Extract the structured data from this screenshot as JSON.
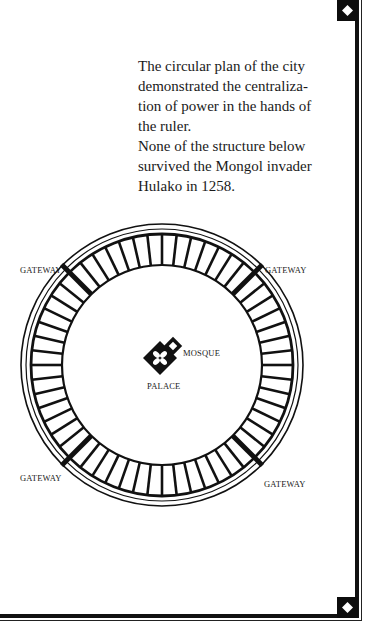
{
  "caption": {
    "paragraphs": [
      "The circular plan of the city demonstrated the centralization of power in the hands of the ruler.",
      "None of the structure below survived the Mongol invader Hulako in 1258."
    ],
    "lines": [
      "The circular plan of the city",
      "demonstrated the centraliza-",
      "tion of power in the hands of",
      "the ruler.",
      "None of the structure below",
      "survived the Mongol invader",
      "Hulako in 1258."
    ]
  },
  "diagram": {
    "labels": {
      "gateway_nw": "GATEWAY",
      "gateway_ne": "GATEWAY",
      "gateway_sw": "GATEWAY",
      "gateway_se": "GATEWAY",
      "mosque": "MOSQUE",
      "palace": "PALACE"
    },
    "ring": {
      "cx": 162,
      "cy": 365,
      "outer_r": 141,
      "outer_inner_r": 136,
      "wall_r": 131,
      "inner_r": 100,
      "segments": 56
    },
    "gateway_angles_deg": [
      225,
      315,
      135,
      45
    ],
    "colors": {
      "ink": "#111111",
      "paper": "#ffffff"
    }
  },
  "frame": {
    "corner_icons": [
      "diamond-icon",
      "diamond-icon"
    ]
  }
}
